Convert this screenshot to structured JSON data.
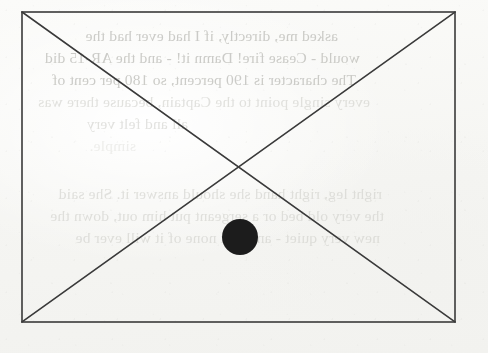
{
  "document": {
    "kind": "scanned-book-page",
    "page_background_color": "#f8f8f6",
    "ink_color": "#3a3a3a",
    "fill_color": "#1c1c1c"
  },
  "figure": {
    "name": "rectangle-with-diagonals-and-dot",
    "rectangle": {
      "left": 22,
      "top": 12,
      "right": 455,
      "bottom": 322,
      "width": 433,
      "height": 310,
      "stroke_width": 1.6
    },
    "diagonals": [
      {
        "name": "diagonal-top-left-to-bottom-right",
        "x1": 22,
        "y1": 12,
        "x2": 455,
        "y2": 322
      },
      {
        "name": "diagonal-bottom-left-to-top-right",
        "x1": 22,
        "y1": 322,
        "x2": 455,
        "y2": 12
      }
    ],
    "intersection_point": {
      "x": 238,
      "y": 167
    },
    "dot": {
      "name": "filled-circle-marker",
      "cx": 240,
      "cy": 237,
      "r": 18
    }
  },
  "bleed_through": {
    "description": "faint mirrored text showing through from the reverse side of the sheet",
    "mirrored": true,
    "lines": [
      {
        "text": "asked me, directly, if I had ever had the",
        "x": 150,
        "y": 27,
        "weight": "normal"
      },
      {
        "text": "would - Cease fire! Damn it! - and the AR-15 did",
        "x": 128,
        "y": 49,
        "weight": "normal"
      },
      {
        "text": "The character is 190 percent, so 180 per cent of",
        "x": 132,
        "y": 71,
        "weight": "normal"
      },
      {
        "text": "every single point to the Captain, because there was",
        "x": 118,
        "y": 93,
        "weight": "faint"
      },
      {
        "text": "all and felt very",
        "x": 300,
        "y": 115,
        "weight": "faint"
      },
      {
        "text": "simple.",
        "x": 352,
        "y": 137,
        "weight": "fainter"
      },
      {
        "text": "right leg, right hand she should answer it. She said",
        "x": 106,
        "y": 185,
        "weight": "faint"
      },
      {
        "text": "the very old bed or a sergeant put him out, down the",
        "x": 104,
        "y": 207,
        "weight": "faint"
      },
      {
        "text": "new very quiet - and that none of it will ever be",
        "x": 108,
        "y": 229,
        "weight": "faint"
      }
    ]
  }
}
